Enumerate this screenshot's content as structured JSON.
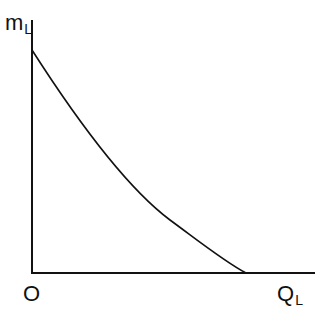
{
  "diagram": {
    "y_axis_label": "m",
    "y_axis_subscript": "L",
    "x_axis_label": "Q",
    "x_axis_subscript": "L",
    "origin_label": "O",
    "line_color": "#111111",
    "curve": {
      "description": "downward-sloping convex curve from y-axis intercept to x-axis intercept",
      "points": [
        [
          32,
          50
        ],
        [
          60,
          95
        ],
        [
          100,
          150
        ],
        [
          138,
          190
        ],
        [
          170,
          220
        ],
        [
          210,
          250
        ],
        [
          246,
          273
        ]
      ]
    }
  }
}
